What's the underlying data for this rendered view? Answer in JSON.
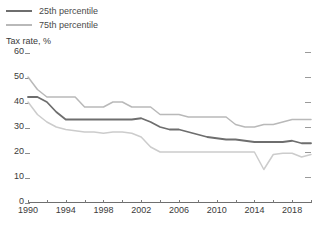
{
  "legend": {
    "position": "top-left",
    "items": [
      {
        "label": "25th percentile",
        "color": "#6e6e6e",
        "name": "legend-25th"
      },
      {
        "label": "75th percentile",
        "color": "#b9b9b9",
        "name": "legend-75th"
      }
    ]
  },
  "axis": {
    "ylabel": "Tax rate, %",
    "yticks": [
      60,
      50,
      40,
      30,
      20,
      10,
      0
    ],
    "ytick_labels": [
      "60",
      "50",
      "40",
      "30",
      "20",
      "10",
      "0"
    ],
    "xtick_labels": [
      "1990",
      "1994",
      "1998",
      "2002",
      "2006",
      "2010",
      "2014",
      "2018"
    ],
    "xticks": [
      1990,
      1994,
      1998,
      2002,
      2006,
      2010,
      2014,
      2018
    ],
    "xlim": [
      1990,
      2020
    ],
    "ylim": [
      0,
      60
    ],
    "grid": false
  },
  "chart_data": {
    "type": "line",
    "title": "",
    "subtitle": "",
    "xlabel": "",
    "ylabel": "Tax rate, %",
    "xlim": [
      1990,
      2020
    ],
    "ylim": [
      0,
      60
    ],
    "grid": false,
    "legend_position": "top-left",
    "x": [
      1990,
      1991,
      1992,
      1993,
      1994,
      1995,
      1996,
      1997,
      1998,
      1999,
      2000,
      2001,
      2002,
      2003,
      2004,
      2005,
      2006,
      2007,
      2008,
      2009,
      2010,
      2011,
      2012,
      2013,
      2014,
      2015,
      2016,
      2017,
      2018,
      2019,
      2020
    ],
    "series": [
      {
        "name": "75th percentile",
        "color": "#b9b9b9",
        "values": [
          50.0,
          45.0,
          42.0,
          42.0,
          42.0,
          42.0,
          38.0,
          38.0,
          38.0,
          40.0,
          40.0,
          38.0,
          38.0,
          38.0,
          35.0,
          35.0,
          35.0,
          34.0,
          34.0,
          34.0,
          34.0,
          34.0,
          31.0,
          30.0,
          30.0,
          31.0,
          31.0,
          32.0,
          33.0,
          33.0,
          33.0
        ]
      },
      {
        "name": "25th percentile",
        "color": "#6e6e6e",
        "values": [
          42.0,
          42.0,
          40.0,
          36.0,
          33.0,
          33.0,
          33.0,
          33.0,
          33.0,
          33.0,
          33.0,
          33.0,
          33.5,
          32.0,
          30.0,
          29.0,
          29.0,
          28.0,
          27.0,
          26.0,
          25.5,
          25.0,
          25.0,
          24.5,
          24.0,
          24.0,
          24.0,
          24.0,
          24.5,
          23.5,
          23.5
        ]
      },
      {
        "name": "25th percentile lower band",
        "color": "#cccccc",
        "values": [
          40.0,
          35.0,
          32.0,
          30.0,
          29.0,
          28.5,
          28.0,
          28.0,
          27.5,
          28.0,
          28.0,
          27.5,
          26.0,
          22.0,
          20.0,
          20.0,
          20.0,
          20.0,
          20.0,
          20.0,
          20.0,
          20.0,
          20.0,
          20.0,
          20.0,
          13.0,
          19.0,
          19.5,
          19.5,
          18.0,
          19.0
        ]
      }
    ]
  }
}
